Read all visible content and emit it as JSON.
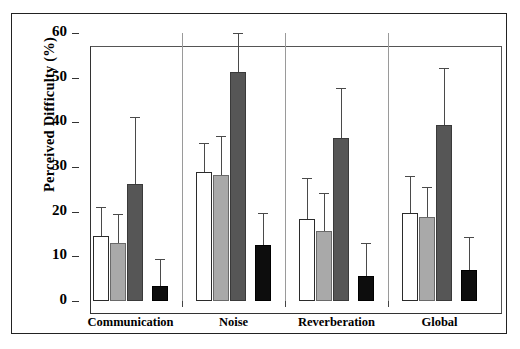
{
  "chart_data": {
    "type": "bar",
    "title": "",
    "xlabel": "",
    "ylabel": "Perceived Difficulty (%)",
    "ylim": [
      0,
      60
    ],
    "yticks": [
      0,
      10,
      20,
      30,
      40,
      50,
      60
    ],
    "ytick_labels": [
      "0",
      "10",
      "20",
      "30",
      "40",
      "50",
      "60"
    ],
    "grid": false,
    "legend": "none",
    "categories": [
      "Communication",
      "Noise",
      "Reverberation",
      "Global"
    ],
    "series": [
      {
        "name": "series-1",
        "fill": "#ffffff",
        "values": [
          14.5,
          28.8,
          18.3,
          19.8
        ],
        "errors_upper": [
          21.0,
          35.3,
          27.6,
          28.0
        ]
      },
      {
        "name": "series-2",
        "fill": "#a9a9a9",
        "values": [
          12.9,
          28.2,
          15.7,
          18.7
        ],
        "errors_upper": [
          19.5,
          37.0,
          24.2,
          25.5
        ]
      },
      {
        "name": "series-3",
        "fill": "#565656",
        "values": [
          26.3,
          51.3,
          36.5,
          39.3
        ],
        "errors_upper": [
          41.3,
          60.0,
          47.6,
          52.2
        ]
      },
      {
        "name": "series-4",
        "fill": "#0d0d0d",
        "values": [
          3.3,
          12.6,
          5.5,
          7.0
        ],
        "errors_upper": [
          9.4,
          19.6,
          13.0,
          14.3
        ]
      }
    ]
  }
}
